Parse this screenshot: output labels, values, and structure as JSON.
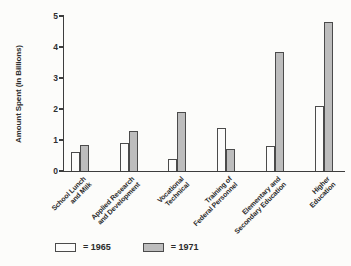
{
  "chart_data": {
    "type": "bar",
    "categories": [
      "School Lunch and Milk",
      "Applied Research and Development",
      "Vocational Technical",
      "Training of Federal Personnel",
      "Elementary and Secondary Education",
      "Higher Education"
    ],
    "category_line_breaks": [
      [
        "School Lunch",
        "and Milk"
      ],
      [
        "Applied Research",
        "and Development"
      ],
      [
        "Vocational",
        "Technical"
      ],
      [
        "Training of",
        "Federal Personnel"
      ],
      [
        "Elementary and",
        "Secondary Education"
      ],
      [
        "Higher",
        "Education"
      ]
    ],
    "series": [
      {
        "name": "1965",
        "values": [
          0.6,
          0.9,
          0.4,
          1.4,
          0.8,
          2.1
        ],
        "color": "#fcfcfb"
      },
      {
        "name": "1971",
        "values": [
          0.85,
          1.3,
          1.9,
          0.7,
          3.85,
          4.8
        ],
        "color": "#bdbdbd"
      }
    ],
    "title": "",
    "xlabel": "",
    "ylabel": "Amount Spent (in Billions)",
    "ylim": [
      0,
      5
    ],
    "yticks": [
      0,
      1,
      2,
      3,
      4,
      5
    ],
    "legend_labels": [
      "= 1965",
      "= 1971"
    ],
    "legend_position": "bottom-left",
    "grid": false,
    "colors": {
      "bar_1965_fill": "#fcfcfb",
      "bar_1971_fill": "#bdbdbd",
      "bar_outline": "#4b4b4b",
      "axis": "#3d3d3d",
      "text": "#2b2b2b",
      "background": "#fcfcfa"
    }
  }
}
